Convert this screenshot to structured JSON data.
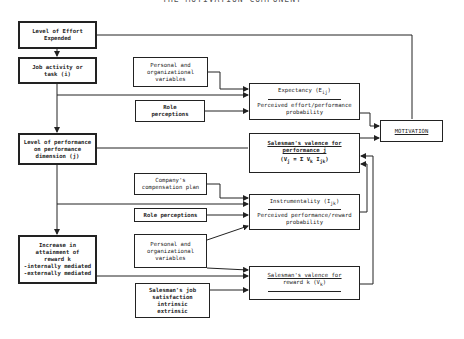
{
  "title": "THE MOTIVATION COMPONENT",
  "left_column": [
    {
      "id": "effort",
      "lines": [
        "Level of Effort",
        "Expended"
      ]
    },
    {
      "id": "job",
      "lines": [
        "Job activity or",
        "task (i)"
      ]
    },
    {
      "id": "performance",
      "lines": [
        "Level of performance",
        "on performance",
        "dimension (j)"
      ]
    },
    {
      "id": "reward",
      "lines": [
        "Increase in",
        "attainment of",
        "reward k",
        "-internally mediated",
        "-externally mediated"
      ]
    }
  ],
  "middle_column": [
    {
      "id": "personal1",
      "lines": [
        "Personal and",
        "organizational",
        "variables"
      ]
    },
    {
      "id": "role1",
      "lines": [
        "Role",
        "perceptions"
      ]
    },
    {
      "id": "compensation",
      "lines": [
        "Company's",
        "compensation plan"
      ]
    },
    {
      "id": "role2",
      "lines": [
        "Role perceptions"
      ]
    },
    {
      "id": "personal2",
      "lines": [
        "Personal and",
        "organizational",
        "variables"
      ]
    },
    {
      "id": "satisfaction",
      "lines": [
        "Salesman's job",
        "satisfaction",
        "intrinsic",
        "extrinsic"
      ]
    }
  ],
  "right_column": {
    "expectancy": {
      "heading": "Expectancy (E",
      "heading_sub": "ij",
      "heading_end": ")",
      "body": [
        "Perceived effort/performance",
        "probability"
      ]
    },
    "valence_performance": {
      "heading": [
        "Salesman's valence for",
        "performance j"
      ],
      "formula": "(V",
      "formula_sub": "j",
      "formula_rest": " = Σ V",
      "formula_sub2": "k",
      "formula_rest2": " I",
      "formula_sub3": "jk",
      "formula_end": ")",
      "sum_limits": "n, k=1"
    },
    "instrumentality": {
      "heading": "Instrumentality (I",
      "heading_sub": "jk",
      "heading_end": ")",
      "body": [
        "Perceived performance/reward",
        "probability"
      ]
    },
    "valence_reward": {
      "heading": [
        "Salesman's valence for",
        "reward k (V"
      ],
      "heading_sub": "k",
      "heading_end": ")"
    }
  },
  "motivation": {
    "label": "MOTIVATION"
  }
}
